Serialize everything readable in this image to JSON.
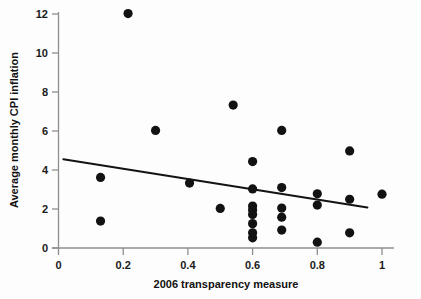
{
  "chart_data": {
    "type": "scatter",
    "title": "",
    "xlabel": "2006 transparency measure",
    "ylabel": "Average monthly CPI inflation",
    "xlim": [
      0,
      1.04
    ],
    "ylim": [
      0,
      12.4
    ],
    "xticks": [
      0,
      0.2,
      0.4,
      0.6,
      0.8,
      1
    ],
    "xtick_labels": [
      "0",
      "0.2",
      "0.4",
      "0.6",
      "0.8",
      "1"
    ],
    "yticks": [
      0,
      2,
      4,
      6,
      8,
      10,
      12
    ],
    "ytick_labels": [
      "0",
      "2",
      "4",
      "6",
      "8",
      "10",
      "12"
    ],
    "grid": false,
    "legend": false,
    "marker": "filled-circle",
    "marker_color": "#121212",
    "points": [
      {
        "x": 0.13,
        "y": 3.62
      },
      {
        "x": 0.13,
        "y": 1.38
      },
      {
        "x": 0.215,
        "y": 12.02
      },
      {
        "x": 0.3,
        "y": 6.03
      },
      {
        "x": 0.405,
        "y": 3.33
      },
      {
        "x": 0.5,
        "y": 2.03
      },
      {
        "x": 0.54,
        "y": 7.33
      },
      {
        "x": 0.6,
        "y": 4.43
      },
      {
        "x": 0.6,
        "y": 3.03
      },
      {
        "x": 0.6,
        "y": 2.15
      },
      {
        "x": 0.6,
        "y": 1.95
      },
      {
        "x": 0.6,
        "y": 1.72
      },
      {
        "x": 0.6,
        "y": 1.25
      },
      {
        "x": 0.6,
        "y": 0.78
      },
      {
        "x": 0.6,
        "y": 0.52
      },
      {
        "x": 0.69,
        "y": 6.03
      },
      {
        "x": 0.69,
        "y": 3.1
      },
      {
        "x": 0.69,
        "y": 2.05
      },
      {
        "x": 0.69,
        "y": 1.58
      },
      {
        "x": 0.69,
        "y": 0.92
      },
      {
        "x": 0.8,
        "y": 2.78
      },
      {
        "x": 0.8,
        "y": 2.2
      },
      {
        "x": 0.8,
        "y": 0.3
      },
      {
        "x": 0.9,
        "y": 4.98
      },
      {
        "x": 0.9,
        "y": 2.5
      },
      {
        "x": 0.9,
        "y": 0.78
      },
      {
        "x": 1.0,
        "y": 2.76
      }
    ],
    "trend_line": {
      "type": "linear-fit",
      "x_start": 0.015,
      "y_start": 4.55,
      "x_end": 0.955,
      "y_end": 2.08,
      "slope": -2.63,
      "intercept": 4.59,
      "color": "#131313"
    }
  },
  "axes": {
    "x_axis_name": "2006 transparency measure",
    "y_axis_name": "Average monthly CPI inflation"
  }
}
